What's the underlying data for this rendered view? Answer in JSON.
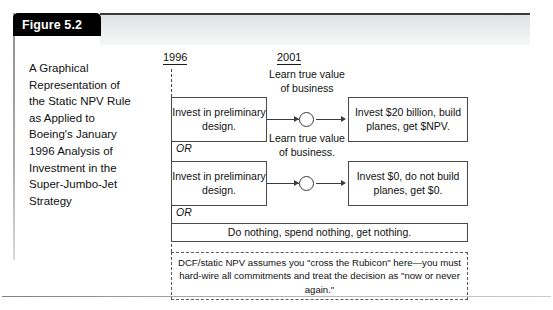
{
  "figure": {
    "tab_label": "Figure 5.2",
    "caption": "A Graphical Representation of the Static NPV Rule as Applied to Boeing's January 1996 Analysis of Investment in the Super-Jumbo-Jet Strategy"
  },
  "diagram": {
    "timeline": {
      "start_year": "1996",
      "end_year": "2001"
    },
    "branches": [
      {
        "action_label": "Invest in preliminary design.",
        "event_label": "Learn true value of business",
        "outcome_label": "Invest $20 billion, build planes, get $NPV."
      },
      {
        "action_label": "Invest in preliminary design.",
        "event_label": "Learn true value of business.",
        "outcome_label": "Invest $0, do not build planes, get $0."
      }
    ],
    "or_label_1": "OR",
    "or_label_2": "OR",
    "do_nothing_label": "Do nothing, spend nothing, get nothing.",
    "note": "DCF/static NPV assumes you \"cross the Rubicon\" here—you must hard-wire all commitments and treat the decision as \"now or never again.\""
  },
  "colors": {
    "tab_background": "#000000",
    "tab_text": "#ffffff",
    "box_border": "#4a4a4a",
    "line": "#3b3b3b",
    "band_top": "#dfe2e4"
  }
}
